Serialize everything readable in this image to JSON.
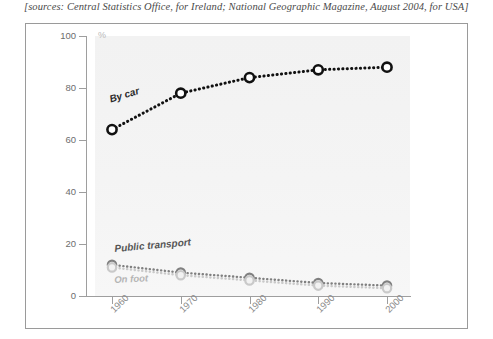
{
  "caption": "[sources: Central Statistics Office, for Ireland; National Geographic Magazine, August 2004, for USA]",
  "axis": {
    "y_unit": "%",
    "y_ticks": [
      "0",
      "20",
      "40",
      "60",
      "80",
      "100"
    ],
    "x_ticks": [
      "1960",
      "1970",
      "1980",
      "1990",
      "2000"
    ]
  },
  "labels": {
    "by_car": "By car",
    "public_transport": "Public transport",
    "on_foot": "On foot"
  },
  "colors": {
    "by_car": "#111111",
    "public_transport": "#808080",
    "on_foot": "#c9c9c9",
    "axis": "#9e9e9e",
    "plot_background": "#f4f4f4",
    "frame": "#9a9a9a",
    "caption_text": "#4a4a4a"
  },
  "chart_data": {
    "type": "line",
    "title": "",
    "subtitle": "",
    "xlabel": "",
    "ylabel": "%",
    "x": [
      1960,
      1970,
      1980,
      1990,
      2000
    ],
    "categories": [
      "1960",
      "1970",
      "1980",
      "1990",
      "2000"
    ],
    "ylim": [
      0,
      100
    ],
    "xlim": [
      1955,
      2005
    ],
    "grid": false,
    "legend": "inline-series-labels",
    "annotations": [
      {
        "text": "By car",
        "series": "By car"
      },
      {
        "text": "Public transport",
        "series": "Public transport"
      },
      {
        "text": "On foot",
        "series": "On foot"
      }
    ],
    "series": [
      {
        "name": "By car",
        "color": "#111111",
        "marker": "circle-open",
        "linestyle": "dotted",
        "values": [
          64,
          78,
          84,
          87,
          88
        ]
      },
      {
        "name": "Public transport",
        "color": "#808080",
        "marker": "circle-open",
        "linestyle": "dotted",
        "values": [
          12,
          9,
          7,
          5,
          4
        ]
      },
      {
        "name": "On foot",
        "color": "#c9c9c9",
        "marker": "circle-open",
        "linestyle": "dotted",
        "values": [
          11,
          8,
          6,
          4,
          3
        ]
      }
    ]
  }
}
